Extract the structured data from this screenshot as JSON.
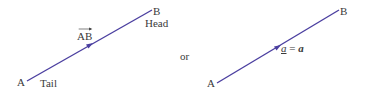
{
  "diagram": {
    "line_color": "#4b3fa0",
    "left": {
      "start_point": {
        "label": "A",
        "x": 27,
        "y": 81
      },
      "end_point": {
        "label": "B",
        "x": 152,
        "y": 10
      },
      "tail_label": "Tail",
      "head_label": "Head",
      "vector_label": "AB"
    },
    "separator": "or",
    "right": {
      "start_point": {
        "label": "A",
        "x": 217,
        "y": 83
      },
      "end_point": {
        "label": "B",
        "x": 339,
        "y": 10
      },
      "vector_label_underlined": "a",
      "equals": "=",
      "vector_label_bold": "a"
    }
  }
}
